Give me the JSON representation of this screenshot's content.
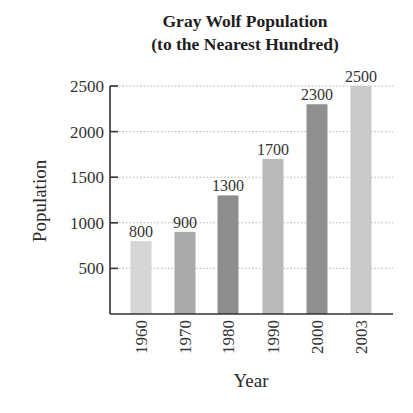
{
  "chart_data": {
    "type": "bar",
    "title": "Gray Wolf Population",
    "subtitle": "(to the Nearest Hundred)",
    "xlabel": "Year",
    "ylabel": "Population",
    "categories": [
      "1960",
      "1970",
      "1980",
      "1990",
      "2000",
      "2003"
    ],
    "values": [
      800,
      900,
      1300,
      1700,
      2300,
      2500
    ],
    "value_labels": [
      "800",
      "900",
      "1300",
      "1700",
      "2300",
      "2500"
    ],
    "bar_colors": [
      "#d6d6d6",
      "#a9a9a9",
      "#8d8d8d",
      "#b9b9b9",
      "#8f8f8f",
      "#c9c9c9"
    ],
    "yticks": [
      500,
      1000,
      1500,
      2000,
      2500
    ],
    "ytick_labels": [
      "500",
      "1000",
      "1500",
      "2000",
      "2500"
    ],
    "ylim": [
      0,
      2500
    ],
    "grid": true,
    "grid_style": "dotted",
    "legend": null,
    "xtick_rotation": -90
  }
}
